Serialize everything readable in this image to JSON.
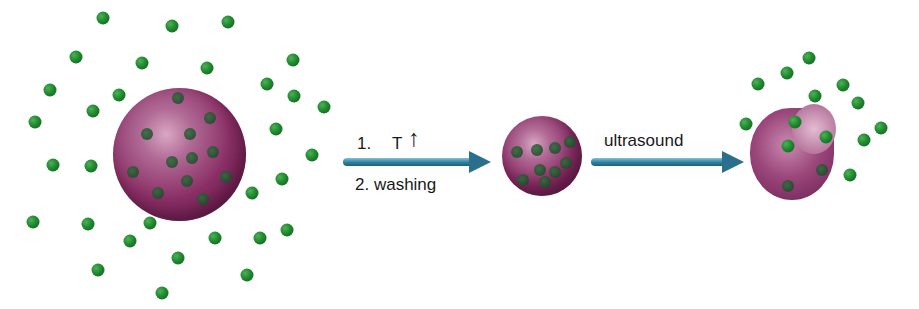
{
  "diagram": {
    "title": "",
    "step1": {
      "line1_number": "1.",
      "line1_symbol": "T",
      "line1_arrow": "↑",
      "line2": "2. washing"
    },
    "step2": {
      "label": "ultrasound"
    },
    "stages": [
      {
        "name": "large loaded particle with free molecules"
      },
      {
        "name": "shrunken loaded particle"
      },
      {
        "name": "ruptured particle releasing molecules"
      }
    ],
    "colors": {
      "particle": "#8a2f66",
      "molecule": "#1f8a2e",
      "arrow": "#2e7f9e"
    }
  }
}
